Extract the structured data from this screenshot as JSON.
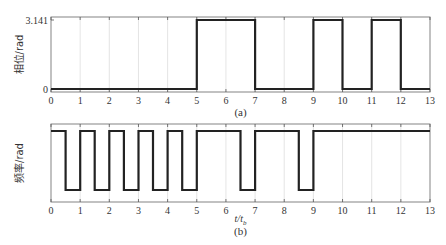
{
  "chart_data": [
    {
      "type": "line",
      "panel": "(a)",
      "title": "",
      "xlabel": "",
      "ylabel": "相位/rad",
      "caption": "(a)",
      "xlim": [
        0,
        13
      ],
      "ylim": [
        0,
        3.141
      ],
      "xticks": [
        0,
        1,
        2,
        3,
        4,
        5,
        6,
        7,
        8,
        9,
        10,
        11,
        12,
        13
      ],
      "yticks": [
        0,
        3.141
      ],
      "ytick_labels": [
        "0",
        "3.141"
      ],
      "grid": "vertical",
      "step": true,
      "x": [
        0,
        5,
        5,
        7,
        7,
        9,
        9,
        10,
        10,
        11,
        11,
        12,
        12,
        13
      ],
      "y": [
        0,
        0,
        3.141,
        3.141,
        0,
        0,
        3.141,
        3.141,
        0,
        0,
        3.141,
        3.141,
        0,
        0
      ],
      "line_color": "#222222"
    },
    {
      "type": "line",
      "panel": "(b)",
      "title": "",
      "xlabel": "t/t_b",
      "ylabel": "频率/rad",
      "caption": "(b)",
      "xlim": [
        0,
        13
      ],
      "ylim": [
        0,
        1
      ],
      "xticks": [
        0,
        1,
        2,
        3,
        4,
        5,
        6,
        7,
        8,
        9,
        10,
        11,
        12,
        13
      ],
      "yticks": [],
      "grid": "vertical",
      "step": true,
      "levels": {
        "high": 1,
        "low": 0
      },
      "x": [
        0,
        0.5,
        0.5,
        1,
        1,
        1.5,
        1.5,
        2,
        2,
        2.5,
        2.5,
        3,
        3,
        3.5,
        3.5,
        4,
        4,
        4.5,
        4.5,
        5,
        5,
        6.5,
        6.5,
        7,
        7,
        8.5,
        8.5,
        9,
        9,
        13
      ],
      "y": [
        1,
        1,
        0,
        0,
        1,
        1,
        0,
        0,
        1,
        1,
        0,
        0,
        1,
        1,
        0,
        0,
        1,
        1,
        0,
        0,
        1,
        1,
        0,
        0,
        1,
        1,
        0,
        0,
        1,
        1
      ],
      "line_color": "#222222"
    }
  ],
  "layout": {
    "panels": [
      {
        "left": 51,
        "right": 430,
        "top": 17,
        "bottom": 92,
        "ytop_px": 20,
        "ybot_px": 89
      },
      {
        "left": 51,
        "right": 430,
        "top": 124,
        "bottom": 202,
        "ytop_px": 131,
        "ybot_px": 190
      }
    ]
  }
}
